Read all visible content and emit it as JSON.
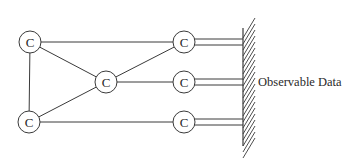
{
  "diagram": {
    "node_label": "C",
    "nodes": [
      {
        "id": "c1",
        "label": "C",
        "x": 30,
        "y": 42
      },
      {
        "id": "c2",
        "label": "C",
        "x": 106,
        "y": 82
      },
      {
        "id": "c3",
        "label": "C",
        "x": 29,
        "y": 122
      },
      {
        "id": "c4",
        "label": "C",
        "x": 184,
        "y": 42
      },
      {
        "id": "c5",
        "label": "C",
        "x": 184,
        "y": 82
      },
      {
        "id": "c6",
        "label": "C",
        "x": 184,
        "y": 122
      }
    ],
    "edges": [
      [
        "c1",
        "c4"
      ],
      [
        "c1",
        "c2"
      ],
      [
        "c1",
        "c3"
      ],
      [
        "c2",
        "c4"
      ],
      [
        "c2",
        "c5"
      ],
      [
        "c3",
        "c2"
      ],
      [
        "c3",
        "c6"
      ]
    ],
    "observation_links": [
      "c4",
      "c5",
      "c6"
    ],
    "observable_label": "Observable Data"
  }
}
